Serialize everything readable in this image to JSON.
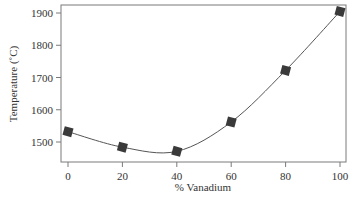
{
  "chart_data": {
    "type": "line",
    "title": "",
    "xlabel": "% Vanadium",
    "ylabel": "Temperature (˚C)",
    "x": [
      0,
      20,
      40,
      60,
      80,
      100
    ],
    "series": [
      {
        "name": "Temperature",
        "values": [
          1532,
          1484,
          1471,
          1562,
          1722,
          1905
        ],
        "marker": "diamond-square",
        "smooth": true
      }
    ],
    "xlim": [
      0,
      100
    ],
    "ylim": [
      1440,
      1925
    ],
    "xticks": [
      0,
      20,
      40,
      60,
      80,
      100
    ],
    "yticks": [
      1500,
      1600,
      1700,
      1800,
      1900
    ],
    "grid": false,
    "legend": null
  },
  "labels": {
    "xlabel": "% Vanadium",
    "ylabel": "Temperature (˚C)",
    "xticks": [
      "0",
      "20",
      "40",
      "60",
      "80",
      "100"
    ],
    "yticks": [
      "1500",
      "1600",
      "1700",
      "1800",
      "1900"
    ]
  },
  "colors": {
    "axis": "#7a7a7a",
    "line": "#555555",
    "marker": "#3a3a3a",
    "text": "#333333"
  }
}
